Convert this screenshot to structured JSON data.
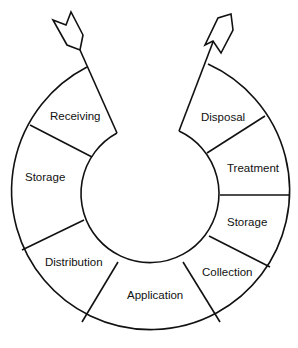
{
  "diagram": {
    "type": "ring-cycle",
    "segments": [
      {
        "label": "Receiving",
        "side": "left"
      },
      {
        "label": "Storage",
        "side": "left"
      },
      {
        "label": "Distribution",
        "side": "left"
      },
      {
        "label": "Application",
        "side": "bottom"
      },
      {
        "label": "Collection",
        "side": "right"
      },
      {
        "label": "Storage",
        "side": "right"
      },
      {
        "label": "Treatment",
        "side": "right"
      },
      {
        "label": "Disposal",
        "side": "right"
      }
    ],
    "arrows": [
      {
        "name": "inbound-arrow",
        "direction": "in",
        "position": "top-left"
      },
      {
        "name": "outbound-arrow",
        "direction": "out",
        "position": "top-right"
      }
    ],
    "colors": {
      "line": "#111111",
      "background": "#ffffff"
    }
  }
}
